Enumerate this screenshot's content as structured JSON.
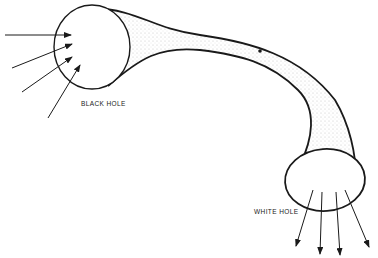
{
  "diagram": {
    "labels": {
      "black_hole": "BLACK HOLE",
      "white_hole": "WHITE HOLE"
    },
    "colors": {
      "stroke": "#1a1a1a",
      "stipple": "#b8b8b8",
      "background": "#ffffff"
    },
    "elements": {
      "black_hole": {
        "shape": "ellipse",
        "incoming_arrows": 4
      },
      "wormhole_tube": {
        "shape": "curved-tube",
        "marker": "dot"
      },
      "white_hole": {
        "shape": "ellipse",
        "outgoing_arrows": 4
      }
    }
  }
}
